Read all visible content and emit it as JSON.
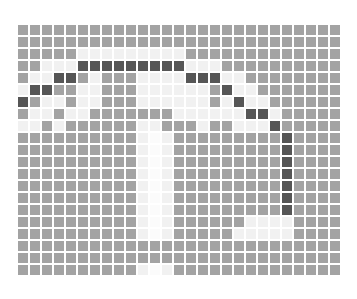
{
  "caption": "",
  "grid": {
    "columns": 27,
    "rows": 21,
    "legend": {
      "g": "#a3a3a3",
      "l": "#f1f1f1",
      "w": "#fbfbfb",
      "d": "#565656"
    },
    "cells": [
      "ggggggggggggggggggggggggggg",
      "ggggggggggggggggggggggggggg",
      "ggggglllllllllggggggggggggg",
      "gglllddddddddddlllggggggggg",
      "glldd glggllllddd llgggggggg",
      "lddgglllgggllllllgdllggggggg",
      "dgllglllgggllllllgldllgggggg",
      "gllgllgggggggllllllddlggggg",
      "llglggggggllggglggllldggggg",
      "ggggggggggwlllgggggggggdgggg",
      "ggggggggggwlllgggggggggdgggg",
      "ggggggggggwlllgggggggggdgggg",
      "ggggggggggwlllgggggggggdgggg",
      "ggggggggggwlllgggggggggdgggg",
      "ggggggggggwlllgggggggggdgggg",
      "ggggggggggwlllgggggggggdgggg",
      "gggggggggglwlggggggllllgggg",
      "gggggggggglwlgggggllllllgggg",
      "ggggggggggggggggggggggggggg",
      "ggggggggggggggggggggggggggg",
      "gggggggggglwlgggggggggggggg"
    ]
  }
}
